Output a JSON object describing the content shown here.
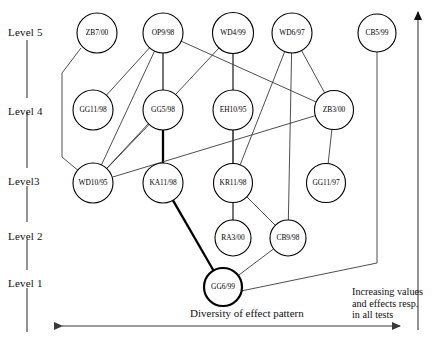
{
  "figure": {
    "type": "hasse-diagram",
    "title": "",
    "background": "#ffffff",
    "edge_color": "#3a3a3a",
    "node_stroke": "#000000",
    "node_fill": "#ffffff"
  },
  "level_labels": [
    {
      "key": "level5",
      "text": "Level 5",
      "x": 8,
      "y": 26
    },
    {
      "key": "level4",
      "text": "Level 4",
      "x": 8,
      "y": 105
    },
    {
      "key": "level3",
      "text": "Level3",
      "x": 8,
      "y": 175
    },
    {
      "key": "level2",
      "text": "Level 2",
      "x": 8,
      "y": 230
    },
    {
      "key": "level1",
      "text": "Level 1",
      "x": 8,
      "y": 277
    }
  ],
  "axis_captions": {
    "x_axis_label": "Diversity of effect pattern",
    "y_axis_label_line1": "Increasing values",
    "y_axis_label_line2": "and effects resp.",
    "y_axis_label_line3": "in all tests"
  },
  "nodes": [
    {
      "id": "ZB7/00",
      "label": "ZB7/00",
      "level": 5,
      "cx": 97,
      "cy": 33,
      "r": 20,
      "bold": false
    },
    {
      "id": "OP9/98",
      "label": "OP9/98",
      "level": 5,
      "cx": 163,
      "cy": 33,
      "r": 20,
      "bold": false
    },
    {
      "id": "WD4/99",
      "label": "WD4/99",
      "level": 5,
      "cx": 233,
      "cy": 33,
      "r": 20.5,
      "bold": false
    },
    {
      "id": "WD6/97",
      "label": "WD6/97",
      "level": 5,
      "cx": 292,
      "cy": 33,
      "r": 20,
      "bold": false
    },
    {
      "id": "CB5/99",
      "label": "CB5/99",
      "level": 5,
      "cx": 377,
      "cy": 33,
      "r": 19,
      "bold": false
    },
    {
      "id": "GG11/98",
      "label": "GG11/98",
      "level": 4,
      "cx": 93,
      "cy": 110,
      "r": 20,
      "bold": false
    },
    {
      "id": "GG5/98",
      "label": "GG5/98",
      "level": 4,
      "cx": 163,
      "cy": 110,
      "r": 20,
      "bold": false
    },
    {
      "id": "EH10/95",
      "label": "EH10/95",
      "level": 4,
      "cx": 233,
      "cy": 110,
      "r": 20,
      "bold": false
    },
    {
      "id": "ZB3/00",
      "label": "ZB3/00",
      "level": 4,
      "cx": 334,
      "cy": 110,
      "r": 19.5,
      "bold": false
    },
    {
      "id": "WD10/95",
      "label": "WD10/95",
      "level": 3,
      "cx": 93,
      "cy": 183,
      "r": 20,
      "bold": false
    },
    {
      "id": "KA11/98",
      "label": "KA11/98",
      "level": 3,
      "cx": 163,
      "cy": 183,
      "r": 20,
      "bold": false
    },
    {
      "id": "KR11/98",
      "label": "KR11/98",
      "level": 3,
      "cx": 233,
      "cy": 183,
      "r": 19.5,
      "bold": false
    },
    {
      "id": "GG11/97",
      "label": "GG11/97",
      "level": 3,
      "cx": 326,
      "cy": 183,
      "r": 19.5,
      "bold": false
    },
    {
      "id": "RA3/00",
      "label": "RA3/00",
      "level": 2,
      "cx": 233,
      "cy": 238,
      "r": 18,
      "bold": false
    },
    {
      "id": "CB9/98",
      "label": "CB9/98",
      "level": 2,
      "cx": 288,
      "cy": 238,
      "r": 18,
      "bold": false
    },
    {
      "id": "GG6/99",
      "label": "GG6/99",
      "level": 1,
      "cx": 223,
      "cy": 287,
      "r": 19,
      "bold": true
    }
  ],
  "edges": [
    {
      "from": "ZB7/00",
      "to": "WD10/95",
      "style": "polyline",
      "points": "81,48 62,73 62,157 80,172",
      "bold": false
    },
    {
      "from": "OP9/98",
      "to": "GG11/98",
      "style": "line",
      "bold": false
    },
    {
      "from": "OP9/98",
      "to": "GG5/98",
      "style": "line",
      "bold": false
    },
    {
      "from": "OP9/98",
      "to": "WD10/95",
      "style": "line",
      "bold": false
    },
    {
      "from": "OP9/98",
      "to": "KA11/98",
      "style": "line",
      "bold": false
    },
    {
      "from": "OP9/98",
      "to": "ZB3/00",
      "style": "line",
      "bold": false
    },
    {
      "from": "WD4/99",
      "to": "EH10/95",
      "style": "line",
      "bold": false
    },
    {
      "from": "WD4/99",
      "to": "WD10/95",
      "style": "line",
      "bold": false
    },
    {
      "from": "WD4/99",
      "to": "KR11/98",
      "style": "line",
      "bold": false
    },
    {
      "from": "WD6/97",
      "to": "ZB3/00",
      "style": "line",
      "bold": false
    },
    {
      "from": "WD6/97",
      "to": "CB9/98",
      "style": "line",
      "bold": false
    },
    {
      "from": "WD6/97",
      "to": "KR11/98",
      "style": "line",
      "bold": false
    },
    {
      "from": "GG11/98",
      "to": "WD10/95",
      "style": "none",
      "bold": false
    },
    {
      "from": "GG5/98",
      "to": "WD10/95",
      "style": "line",
      "bold": false
    },
    {
      "from": "GG5/98",
      "to": "KA11/98",
      "style": "line",
      "bold": true
    },
    {
      "from": "EH10/95",
      "to": "KR11/98",
      "style": "line",
      "bold": false
    },
    {
      "from": "EH10/95",
      "to": "RA3/00",
      "style": "line",
      "bold": false
    },
    {
      "from": "ZB3/00",
      "to": "GG11/97",
      "style": "line",
      "bold": false
    },
    {
      "from": "ZB3/00",
      "to": "WD10/95",
      "style": "line",
      "bold": false
    },
    {
      "from": "KA11/98",
      "to": "GG6/99",
      "style": "line",
      "bold": true
    },
    {
      "from": "KR11/98",
      "to": "RA3/00",
      "style": "line",
      "bold": false
    },
    {
      "from": "KR11/98",
      "to": "CB9/98",
      "style": "line",
      "bold": false
    },
    {
      "from": "RA3/00",
      "to": "GG6/99",
      "style": "none",
      "bold": false
    },
    {
      "from": "CB9/98",
      "to": "GG6/99",
      "style": "line",
      "bold": false
    },
    {
      "from": "CB5/99",
      "to": "GG6/99",
      "style": "polyline",
      "points": "377,52 377,263 241,291",
      "bold": false
    }
  ],
  "level_axis": {
    "x": 27,
    "segments": [
      {
        "y1": 40,
        "y2": 98
      },
      {
        "y1": 112,
        "y2": 168
      },
      {
        "y1": 186,
        "y2": 222
      },
      {
        "y1": 240,
        "y2": 270
      },
      {
        "y1": 288,
        "y2": 332
      }
    ]
  },
  "x_arrow": {
    "x1": 62,
    "x2": 400,
    "y": 326
  },
  "y_arrow": {
    "x": 418,
    "y1": 330,
    "y2": 12
  }
}
